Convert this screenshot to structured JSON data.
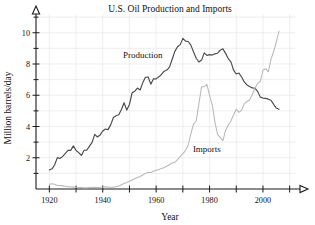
{
  "chart_data": {
    "type": "line",
    "title": "U.S. Oil Production and Imports",
    "xlabel": "Year",
    "ylabel": "Million barrels/day",
    "xlim": [
      1915,
      2012
    ],
    "ylim": [
      0,
      11.2
    ],
    "xticks": [
      1920,
      1930,
      1940,
      1950,
      1960,
      1970,
      1980,
      1990,
      2000,
      2010
    ],
    "xtick_labels": [
      "1920",
      "",
      "1940",
      "",
      "1960",
      "",
      "1980",
      "",
      "2000",
      ""
    ],
    "yticks": [
      1,
      2,
      3,
      4,
      5,
      6,
      7,
      8,
      9,
      10,
      11
    ],
    "ytick_labels": [
      "",
      "2",
      "",
      "4",
      "",
      "6",
      "",
      "8",
      "",
      "10",
      ""
    ],
    "grid": true,
    "legend": "inline-annotations",
    "annotations": [
      {
        "text": "Production",
        "x": 1955,
        "y": 8.4
      },
      {
        "text": "Imports",
        "x": 1979,
        "y": 2.35
      }
    ],
    "series": [
      {
        "name": "Production",
        "color": "#4a4a4a",
        "x": [
          1920,
          1921,
          1922,
          1923,
          1924,
          1925,
          1926,
          1927,
          1928,
          1929,
          1930,
          1931,
          1932,
          1933,
          1934,
          1935,
          1936,
          1937,
          1938,
          1939,
          1940,
          1941,
          1942,
          1943,
          1944,
          1945,
          1946,
          1947,
          1948,
          1949,
          1950,
          1951,
          1952,
          1953,
          1954,
          1955,
          1956,
          1957,
          1958,
          1959,
          1960,
          1961,
          1962,
          1963,
          1964,
          1965,
          1966,
          1967,
          1968,
          1969,
          1970,
          1971,
          1972,
          1973,
          1974,
          1975,
          1976,
          1977,
          1978,
          1979,
          1980,
          1981,
          1982,
          1983,
          1984,
          1985,
          1986,
          1987,
          1988,
          1989,
          1990,
          1991,
          1992,
          1993,
          1994,
          1995,
          1996,
          1997,
          1998,
          1999,
          2000,
          2001,
          2002,
          2003,
          2004,
          2005,
          2006
        ],
        "y": [
          1.21,
          1.29,
          1.55,
          2.01,
          1.95,
          2.09,
          2.28,
          2.47,
          2.47,
          2.76,
          2.46,
          2.33,
          2.15,
          2.48,
          2.49,
          2.73,
          2.98,
          3.5,
          3.33,
          3.46,
          3.71,
          3.84,
          3.8,
          4.12,
          4.58,
          4.69,
          4.75,
          5.09,
          5.52,
          5.05,
          5.41,
          6.16,
          6.26,
          6.46,
          6.34,
          6.81,
          7.15,
          7.17,
          6.71,
          7.05,
          7.05,
          7.18,
          7.33,
          7.54,
          7.61,
          7.8,
          8.3,
          8.81,
          9.1,
          9.24,
          9.64,
          9.46,
          9.44,
          9.21,
          8.77,
          8.37,
          8.13,
          8.25,
          8.71,
          8.55,
          8.6,
          8.57,
          8.65,
          8.69,
          8.88,
          8.97,
          8.68,
          8.35,
          8.14,
          7.61,
          7.36,
          7.42,
          7.17,
          6.85,
          6.66,
          6.56,
          6.47,
          6.45,
          6.25,
          5.88,
          5.82,
          5.8,
          5.75,
          5.68,
          5.42,
          5.18,
          5.1
        ]
      },
      {
        "name": "Imports",
        "color": "#b8b8b8",
        "x": [
          1920,
          1921,
          1922,
          1923,
          1924,
          1925,
          1926,
          1927,
          1928,
          1929,
          1930,
          1931,
          1932,
          1933,
          1934,
          1935,
          1936,
          1937,
          1938,
          1939,
          1940,
          1941,
          1942,
          1943,
          1944,
          1945,
          1946,
          1947,
          1948,
          1949,
          1950,
          1951,
          1952,
          1953,
          1954,
          1955,
          1956,
          1957,
          1958,
          1959,
          1960,
          1961,
          1962,
          1963,
          1964,
          1965,
          1966,
          1967,
          1968,
          1969,
          1970,
          1971,
          1972,
          1973,
          1974,
          1975,
          1976,
          1977,
          1978,
          1979,
          1980,
          1981,
          1982,
          1983,
          1984,
          1985,
          1986,
          1987,
          1988,
          1989,
          1990,
          1991,
          1992,
          1993,
          1994,
          1995,
          1996,
          1997,
          1998,
          1999,
          2000,
          2001,
          2002,
          2003,
          2004,
          2005,
          2006
        ],
        "y": [
          0.31,
          0.33,
          0.3,
          0.23,
          0.22,
          0.2,
          0.17,
          0.15,
          0.13,
          0.12,
          0.11,
          0.1,
          0.09,
          0.08,
          0.08,
          0.09,
          0.1,
          0.11,
          0.1,
          0.11,
          0.12,
          0.14,
          0.12,
          0.11,
          0.12,
          0.15,
          0.19,
          0.27,
          0.36,
          0.42,
          0.49,
          0.57,
          0.65,
          0.73,
          0.8,
          0.9,
          1.0,
          1.07,
          1.06,
          1.13,
          1.2,
          1.25,
          1.32,
          1.38,
          1.46,
          1.57,
          1.67,
          1.71,
          1.88,
          2.07,
          2.27,
          2.46,
          2.8,
          3.55,
          4.15,
          4.35,
          5.45,
          6.54,
          6.55,
          6.7,
          5.98,
          5.4,
          4.3,
          3.5,
          3.3,
          3.1,
          3.75,
          4.1,
          4.35,
          4.75,
          5.1,
          4.9,
          5.05,
          5.45,
          5.6,
          5.7,
          6.05,
          6.45,
          6.75,
          6.9,
          7.6,
          7.7,
          7.5,
          8.3,
          8.8,
          9.4,
          10.1
        ]
      }
    ]
  },
  "axes": {
    "x_axis_name": "year-axis",
    "y_axis_name": "million-barrels-axis"
  }
}
